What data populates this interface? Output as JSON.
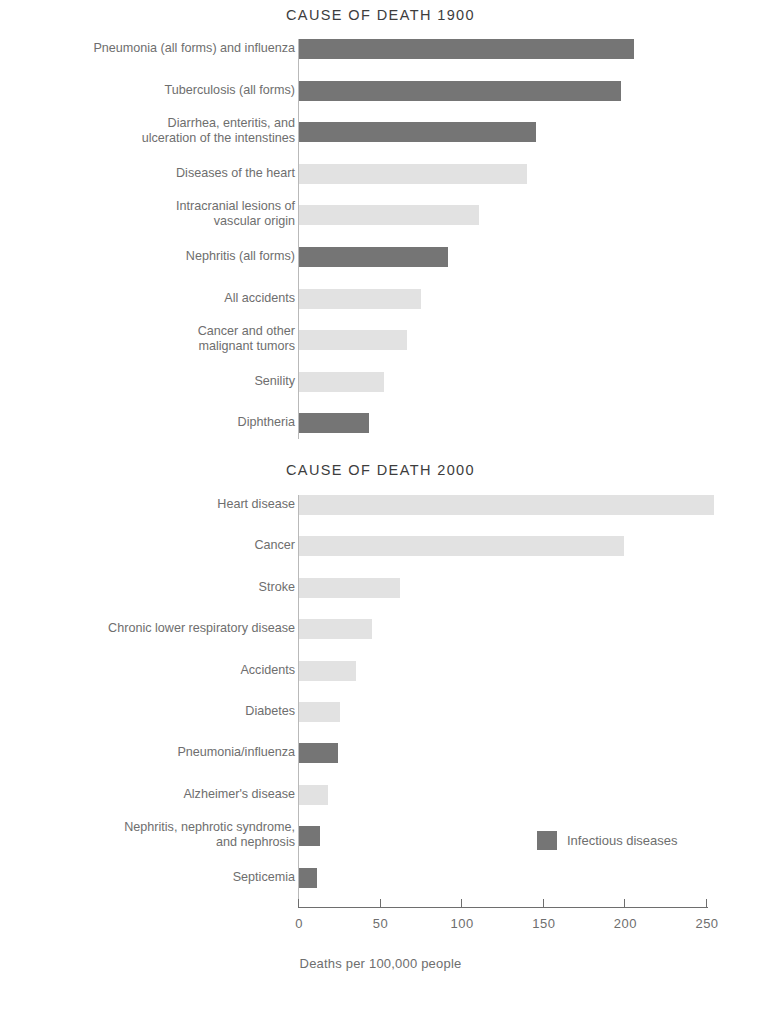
{
  "axis": {
    "title": "Deaths per 100,000 people",
    "ticks": [
      {
        "value": 0,
        "label": "0"
      },
      {
        "value": 50,
        "label": "50"
      },
      {
        "value": 100,
        "label": "100"
      },
      {
        "value": 150,
        "label": "150"
      },
      {
        "value": 200,
        "label": "200"
      },
      {
        "value": 250,
        "label": "250"
      }
    ],
    "xlim": [
      0,
      250
    ]
  },
  "legend": {
    "label": "Infectious diseases",
    "swatch_color": "#757575"
  },
  "colors": {
    "infectious": "#757575",
    "non_infectious": "#e2e2e2",
    "title": "#3d3d3d",
    "label": "#6e6e6e",
    "axis": "#6e6e6e"
  },
  "chart_data": [
    {
      "type": "bar",
      "orientation": "horizontal",
      "title": "CAUSE OF DEATH 1900",
      "xlabel": "Deaths per 100,000 people",
      "ylabel": "",
      "xlim": [
        0,
        250
      ],
      "grid": false,
      "legend_position": "none",
      "categories": [
        "Pneumonia (all forms) and influenza",
        "Tuberculosis (all forms)",
        "Diarrhea, enteritis, and\nulceration of the intenstines",
        "Diseases of the heart",
        "Intracranial lesions of\nvascular origin",
        "Nephritis (all forms)",
        "All accidents",
        "Cancer and other\nmalignant tumors",
        "Senility",
        "Diphtheria"
      ],
      "values": [
        205,
        197,
        145,
        140,
        110,
        91,
        75,
        66,
        52,
        43
      ],
      "series": [
        {
          "name": "Deaths per 100,000 people",
          "values": [
            205,
            197,
            145,
            140,
            110,
            91,
            75,
            66,
            52,
            43
          ]
        }
      ],
      "infectious": [
        true,
        true,
        true,
        false,
        false,
        true,
        false,
        false,
        false,
        true
      ]
    },
    {
      "type": "bar",
      "orientation": "horizontal",
      "title": "CAUSE OF DEATH 2000",
      "xlabel": "Deaths per 100,000 people",
      "ylabel": "",
      "xlim": [
        0,
        250
      ],
      "grid": false,
      "legend_position": "inside-right",
      "categories": [
        "Heart disease",
        "Cancer",
        "Stroke",
        "Chronic lower respiratory disease",
        "Accidents",
        "Diabetes",
        "Pneumonia/influenza",
        "Alzheimer's disease",
        "Nephritis, nephrotic syndrome,\nand nephrosis",
        "Septicemia"
      ],
      "values": [
        254,
        199,
        62,
        45,
        35,
        25,
        24,
        18,
        13,
        11
      ],
      "series": [
        {
          "name": "Deaths per 100,000 people",
          "values": [
            254,
            199,
            62,
            45,
            35,
            25,
            24,
            18,
            13,
            11
          ]
        }
      ],
      "infectious": [
        false,
        false,
        false,
        false,
        false,
        false,
        true,
        false,
        true,
        true
      ]
    }
  ]
}
